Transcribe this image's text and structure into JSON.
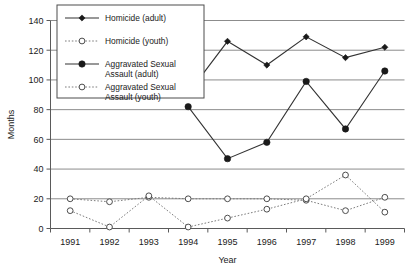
{
  "chart_data": {
    "type": "line",
    "title": "",
    "xlabel": "Year",
    "ylabel": "Months",
    "x": [
      1991,
      1992,
      1993,
      1994,
      1995,
      1996,
      1997,
      1998,
      1999
    ],
    "categories": [
      "1991",
      "1992",
      "1993",
      "1994",
      "1995",
      "1996",
      "1997",
      "1998",
      "1999"
    ],
    "ylim": [
      0,
      140
    ],
    "yticks": [
      0,
      20,
      40,
      60,
      80,
      100,
      120,
      140
    ],
    "ytick_labels": [
      "0",
      "20",
      "40",
      "60",
      "80",
      "100",
      "120",
      "140"
    ],
    "grid": true,
    "legend_position": "top-left-inside",
    "series": [
      {
        "name": "Homicide (adult)",
        "style": "solid",
        "marker": "filled-diamond",
        "color": "#1a1a1a",
        "x": [
          1994,
          1995,
          1996,
          1997,
          1998,
          1999
        ],
        "values": [
          91,
          126,
          110,
          129,
          115,
          122
        ]
      },
      {
        "name": "Homicide (youth)",
        "style": "dotted",
        "marker": "open-circle",
        "color": "#4d4d4d",
        "x": [
          1991,
          1992,
          1993,
          1994,
          1995,
          1996,
          1997,
          1998,
          1999
        ],
        "values": [
          20,
          18,
          21,
          20,
          20,
          20,
          19,
          12,
          21
        ]
      },
      {
        "name": "Aggravated Sexual Assault (adult)",
        "style": "solid",
        "marker": "filled-circle",
        "color": "#1a1a1a",
        "x": [
          1994,
          1995,
          1996,
          1997,
          1998,
          1999
        ],
        "values": [
          82,
          47,
          58,
          99,
          67,
          106
        ]
      },
      {
        "name": "Aggravated Sexual Assault (youth)",
        "style": "dotted",
        "marker": "open-circle",
        "color": "#4d4d4d",
        "x": [
          1991,
          1992,
          1993,
          1994,
          1995,
          1996,
          1997,
          1998,
          1999
        ],
        "values": [
          12,
          1,
          22,
          1,
          7,
          13,
          20,
          36,
          11
        ]
      }
    ]
  },
  "legend": {
    "entries": [
      {
        "label": "Homicide (adult)"
      },
      {
        "label": "Homicide (youth)"
      },
      {
        "label": "Aggravated Sexual"
      },
      {
        "label": "Assault (adult)"
      },
      {
        "label": "Aggravated Sexual"
      },
      {
        "label": "Assault (youth)"
      }
    ]
  },
  "axes": {
    "y_title": "Months",
    "x_title": "Year"
  }
}
